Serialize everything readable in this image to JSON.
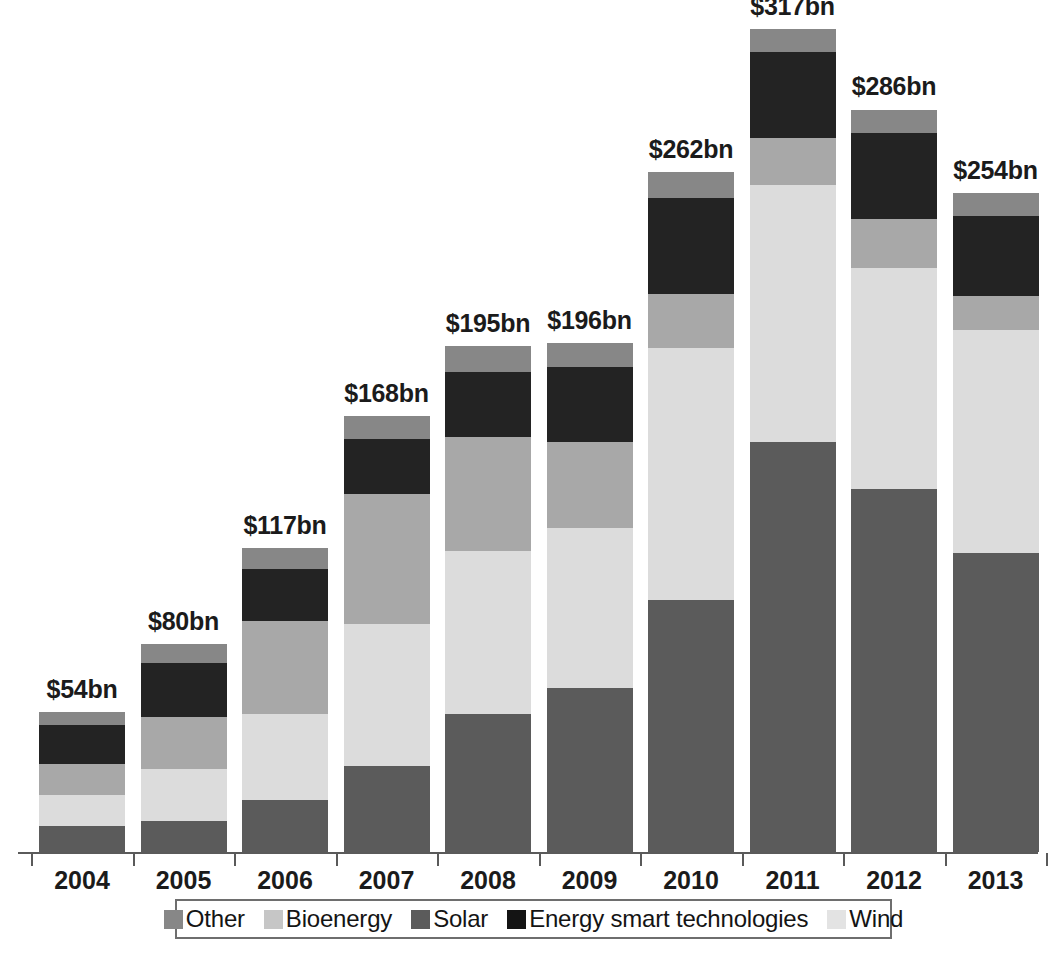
{
  "chart_data": {
    "type": "bar",
    "subtype": "stacked-bar",
    "title": "",
    "subtitle": "",
    "xlabel": "",
    "ylabel": "",
    "ylim": [
      0,
      317
    ],
    "grid": false,
    "legend_position": "bottom",
    "value_unit": "US$ billion",
    "categories": [
      "2004",
      "2005",
      "2006",
      "2007",
      "2008",
      "2009",
      "2010",
      "2011",
      "2012",
      "2013"
    ],
    "totals": [
      54,
      80,
      117,
      168,
      195,
      196,
      262,
      317,
      286,
      254
    ],
    "total_labels": [
      "$54bn",
      "$80bn",
      "$117bn",
      "$168bn",
      "$195bn",
      "$196bn",
      "$262bn",
      "$317bn",
      "$286bn",
      "$254bn"
    ],
    "stack_order_bottom_to_top": [
      "Solar",
      "Wind",
      "Bioenergy",
      "Energy smart technologies",
      "Other"
    ],
    "series": [
      {
        "name": "Solar",
        "color": "#5b5b5b",
        "values": [
          10,
          12,
          20,
          33,
          53,
          63,
          97,
          158,
          140,
          115
        ]
      },
      {
        "name": "Wind",
        "color": "#dcdcdc",
        "values": [
          12,
          20,
          33,
          55,
          63,
          62,
          97,
          99,
          85,
          86
        ]
      },
      {
        "name": "Bioenergy",
        "color": "#a8a8a8",
        "values": [
          12,
          20,
          36,
          50,
          44,
          33,
          21,
          18,
          19,
          13
        ]
      },
      {
        "name": "Energy smart technologies",
        "color": "#232323",
        "values": [
          15,
          21,
          20,
          21,
          25,
          29,
          37,
          33,
          33,
          31
        ]
      },
      {
        "name": "Other",
        "color": "#878787",
        "values": [
          5,
          7,
          8,
          9,
          10,
          9,
          10,
          9,
          9,
          9
        ]
      }
    ]
  },
  "legend": {
    "items": [
      {
        "label": "Other",
        "color": "#878787",
        "icon": "legend-swatch-other"
      },
      {
        "label": "Bioenergy",
        "color": "#c6c6c6",
        "icon": "legend-swatch-bioenergy"
      },
      {
        "label": "Solar",
        "color": "#5b5b5b",
        "icon": "legend-swatch-solar"
      },
      {
        "label": "Energy smart technologies",
        "color": "#141414",
        "icon": "legend-swatch-energy-smart-technologies"
      },
      {
        "label": "Wind",
        "color": "#e3e3e3",
        "icon": "legend-swatch-wind"
      }
    ]
  },
  "axis": {
    "x_tick_labels": [
      "2004",
      "2005",
      "2006",
      "2007",
      "2008",
      "2009",
      "2010",
      "2011",
      "2012",
      "2013"
    ]
  }
}
